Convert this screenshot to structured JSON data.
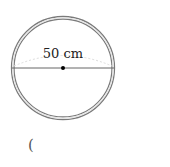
{
  "figure": {
    "diameter_label": "50 cm",
    "answer_paren": "(",
    "colors": {
      "ring": "#7a7a7a",
      "diameter": "#666666",
      "arc": "#d8d8d8",
      "center": "#000000"
    }
  }
}
